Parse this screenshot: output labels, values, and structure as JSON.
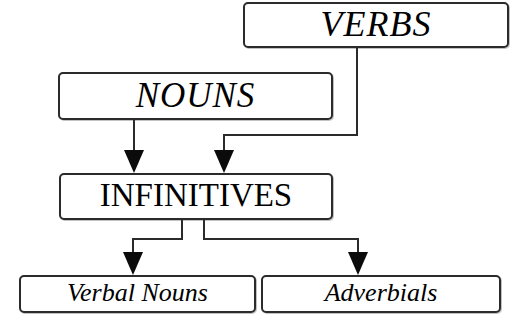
{
  "diagram": {
    "type": "hierarchy-flowchart",
    "background_color": "#ffffff",
    "line_color": "#2b2b2b",
    "nodes": [
      {
        "id": "verbs",
        "label": "VERBS",
        "style": "italic-caps"
      },
      {
        "id": "nouns",
        "label": "NOUNS",
        "style": "italic-caps"
      },
      {
        "id": "infinitives",
        "label": "INFINITIVES",
        "style": "roman-caps"
      },
      {
        "id": "verbal_nouns",
        "label": "Verbal Nouns",
        "style": "italic-title"
      },
      {
        "id": "adverbials",
        "label": "Adverbials",
        "style": "italic-title"
      }
    ],
    "edges": [
      {
        "id": "verbs-infinitives",
        "from": "VERBS",
        "to": "INFINITIVES",
        "arrow": "down"
      },
      {
        "id": "nouns-infinitives",
        "from": "NOUNS",
        "to": "INFINITIVES",
        "arrow": "down"
      },
      {
        "id": "infinitives-verbalnouns",
        "from": "INFINITIVES",
        "to": "Verbal Nouns",
        "arrow": "down"
      },
      {
        "id": "infinitives-adverbials",
        "from": "INFINITIVES",
        "to": "Adverbials",
        "arrow": "down"
      }
    ]
  }
}
